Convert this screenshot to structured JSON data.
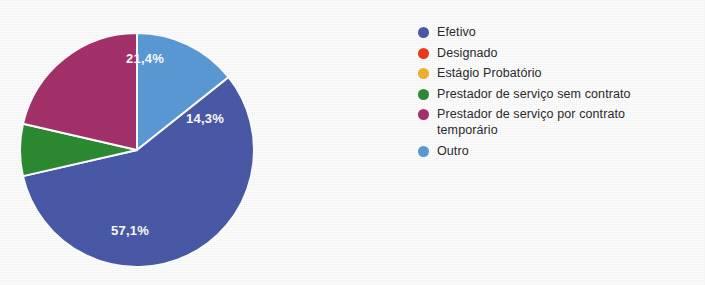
{
  "chart_data": {
    "type": "pie",
    "title": "",
    "labels": [
      "Efetivo",
      "Designado",
      "Estágio Probatório",
      "Prestador de serviço sem contrato",
      "Prestador de serviço por contrato temporário",
      "Outro"
    ],
    "values": [
      57.1,
      0,
      0,
      7.2,
      21.4,
      14.3
    ],
    "value_unit": "%",
    "colors": [
      "#4a5aa8",
      "#ee3a18",
      "#f2b332",
      "#2e8b33",
      "#a8partial",
      "#5b9bd8"
    ],
    "slice_colors": {
      "efetivo": "#4a5aa8",
      "designado": "#ee3a18",
      "estagio_probatorio": "#f2b332",
      "prestador_sem_contrato": "#2e8b33",
      "prestador_contrato_temporario": "#a6326b",
      "outro": "#5b9bd8"
    },
    "visible_slice_labels": [
      {
        "text": "14,3%",
        "value": 14.3,
        "series": "Outro"
      },
      {
        "text": "57,1%",
        "value": 57.1,
        "series": "Efetivo"
      },
      {
        "text": "21,4%",
        "value": 21.4,
        "series": "Prestador de serviço por contrato temporário"
      }
    ],
    "start_angle_deg": 0,
    "direction": "clockwise",
    "legend_position": "right",
    "grid": false,
    "label_text_color": "#ffffff"
  },
  "pie": {
    "geometry": {
      "cx": 137,
      "cy": 150,
      "r": 117
    },
    "slices": [
      {
        "name": "Outro",
        "color": "#5b9bd8",
        "percent": 14.3,
        "start_deg": 0,
        "end_deg": 51.5,
        "label": "14,3%",
        "label_x": 205,
        "label_y": 120,
        "show_label": true
      },
      {
        "name": "Efetivo",
        "color": "#4a5aa8",
        "percent": 57.1,
        "start_deg": 51.5,
        "end_deg": 257.1,
        "label": "57,1%",
        "label_x": 130,
        "label_y": 232,
        "show_label": true
      },
      {
        "name": "Prestador de serviço sem contrato",
        "color": "#2e8b33",
        "percent": 7.2,
        "start_deg": 257.1,
        "end_deg": 283.0,
        "label": "7,2%",
        "label_x": 0,
        "label_y": 0,
        "show_label": false
      },
      {
        "name": "Prestador de serviço por contrato temporário",
        "color": "#a6326b",
        "percent": 21.4,
        "start_deg": 283.0,
        "end_deg": 360.0,
        "label": "21,4%",
        "label_x": 145,
        "label_y": 60,
        "show_label": true
      }
    ]
  },
  "legend": {
    "items": [
      {
        "label": "Efetivo",
        "color": "#4a5aa8"
      },
      {
        "label": "Designado",
        "color": "#ee3a18"
      },
      {
        "label": "Estágio Probatório",
        "color": "#f2b332"
      },
      {
        "label": "Prestador de serviço sem contrato",
        "color": "#2e8b33"
      },
      {
        "label": "Prestador de serviço por contrato temporário",
        "color": "#a6326b"
      },
      {
        "label": "Outro",
        "color": "#5b9bd8"
      }
    ]
  }
}
